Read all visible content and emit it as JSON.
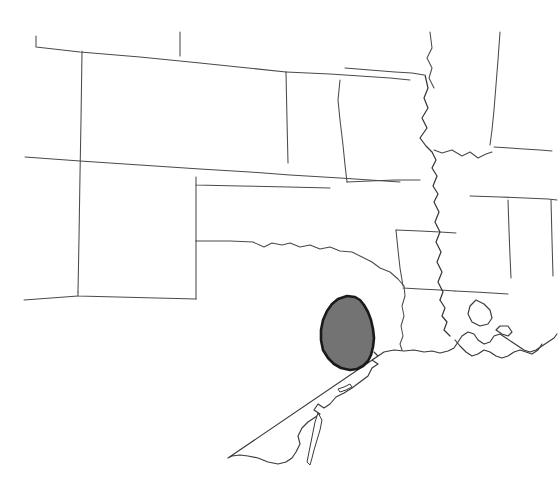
{
  "figure": {
    "kind": "distribution-range-map",
    "region_description": "South-central United States",
    "width": 558,
    "height": 485,
    "background_color": "#ffffff"
  },
  "style": {
    "state_border_color": "#4a4a4a",
    "coastline_color": "#3a3a3a",
    "river_color": "#333333",
    "range_fill_color": "#737373",
    "range_outline_color": "#1a1a1a",
    "range_fill_opacity": "1"
  },
  "range": {
    "label": "shaded-distribution-area",
    "location": "southeast Texas coastal plain",
    "fill_color": "#737373",
    "outline_color": "#1a1a1a",
    "bounds": {
      "x_min": 321,
      "y_min": 296,
      "x_max": 375,
      "y_max": 370
    },
    "path": "M 355 297 L 347 296 L 338 299 L 332 304 L 327 311 L 323 320 L 321 330 L 321 340 L 323 350 L 328 358 L 334 364 L 341 368 L 350 370 L 357 369 L 363 366 L 368 361 L 371 355 L 373 347 L 374 338 L 373 329 L 371 320 L 368 312 L 364 305 L 360 300 Z"
  },
  "geography": {
    "state_borders": [
      {
        "name": "colorado-wyoming-nebraska-north",
        "path": "M 36 36 L 36 47 L 80 52 L 140 57 L 200 63 L 248 68 L 286 72"
      },
      {
        "name": "wyoming-nebraska-vertical-tick",
        "path": "M 180 32 L 180 56"
      },
      {
        "name": "utah-colorado-west",
        "path": "M 82 51 L 81 120 L 80 175 L 79 238 L 78 292"
      },
      {
        "name": "colorado-south-kansas-south",
        "path": "M 25 157 L 80 161 L 140 165 L 200 169 L 250 172 L 290 175 L 340 178 L 400 182"
      },
      {
        "name": "colorado-east-kansas-west",
        "path": "M 286 72 L 287 120 L 288 163"
      },
      {
        "name": "kansas-oklahoma-panhandle-step",
        "path": "M 196 177 L 196 185 L 240 186 L 288 187 L 330 188"
      },
      {
        "name": "oklahoma-panhandle-west",
        "path": "M 196 185 L 196 241"
      },
      {
        "name": "texas-panhandle-north-west",
        "path": "M 78 292 L 78 296 L 196 299"
      },
      {
        "name": "new-mexico-texas-east",
        "path": "M 196 241 L 196 299"
      },
      {
        "name": "new-mexico-south-border",
        "path": "M 24 300 L 78 296"
      },
      {
        "name": "oklahoma-texas-red-river",
        "path": "M 196 241 L 230 241 L 253 242 L 264 247 L 272 243 L 282 245 L 290 243 L 300 247 L 310 245 L 320 249 L 330 247 L 340 251 L 352 252 L 362 257 L 372 262 L 380 268 L 390 272 L 398 279 L 404 286"
      },
      {
        "name": "arkansas-north-missouri-south",
        "path": "M 396 230 L 420 231 L 440 232 L 456 233"
      },
      {
        "name": "arkansas-west-oklahoma-east",
        "path": "M 396 230 L 398 250 L 400 268 L 403 286"
      },
      {
        "name": "arkansas-south-louisiana-north",
        "path": "M 403 288 L 420 289 L 440 290 L 455 291"
      },
      {
        "name": "texas-louisiana-east-sabine",
        "path": "M 404 286 L 405 296 L 402 306 L 404 316 L 401 326 L 403 336 L 400 344 L 402 350"
      },
      {
        "name": "kansas-nebraska-north-missouri",
        "path": "M 286 72 L 330 74 L 360 76 L 390 78 L 410 80"
      },
      {
        "name": "missouri-iowa-north",
        "path": "M 345 68 L 370 70 L 395 72 L 412 73 L 424 75"
      },
      {
        "name": "missouri-west-kansas-east",
        "path": "M 340 80 L 338 100 L 340 120 L 343 145 L 345 165 L 347 182"
      },
      {
        "name": "missouri-south-arkansas-north",
        "path": "M 347 182 L 370 181 L 395 180 L 420 180"
      },
      {
        "name": "illinois-iowa-north-tick",
        "path": "M 430 32 L 432 48 L 427 58 L 432 68 L 429 78 L 434 88"
      },
      {
        "name": "indiana-illinois-wabash",
        "path": "M 500 32 L 498 60 L 496 85 L 494 110 L 492 130 L 490 145"
      },
      {
        "name": "kentucky-tennessee-north",
        "path": "M 494 147 L 510 148 L 524 149 L 540 150 L 552 151"
      },
      {
        "name": "tennessee-mississippi-alabama-north",
        "path": "M 470 196 L 500 197 L 525 198 L 548 199 L 557 200"
      },
      {
        "name": "mississippi-alabama-vertical",
        "path": "M 508 200 L 509 230 L 510 256 L 511 278"
      },
      {
        "name": "alabama-georgia-vertical",
        "path": "M 551 200 L 552 240 L 553 276"
      },
      {
        "name": "mississippi-louisiana-north",
        "path": "M 455 291 L 475 292 L 492 293 L 508 294"
      },
      {
        "name": "kentucky-illinois-ohio-river",
        "path": "M 434 150 L 442 153 L 452 150 L 462 156 L 470 152 L 478 158 L 486 154 L 492 152"
      }
    ],
    "rivers": [
      {
        "name": "mississippi-river-missouri-illinois",
        "path": "M 425 75 L 428 88 L 424 98 L 428 108 L 422 118 L 427 128 L 420 138 L 426 146 L 432 152 L 436 160 L 432 168 L 437 176 L 433 186 L 438 194 L 434 202 L 439 212 L 435 222 L 440 232 L 436 242 L 441 252 L 437 262 L 442 272 L 438 282 L 443 292 L 440 300"
      },
      {
        "name": "mississippi-river-lower",
        "path": "M 440 300 L 445 308 L 442 316 L 447 322 L 444 330 L 450 336"
      }
    ],
    "coastline": {
      "name": "gulf-of-mexico-coastline",
      "path": "M 374 352 L 378 356 L 372 360 L 378 364 L 372 368 L 368 376 L 360 382 L 352 388 L 344 393 L 336 397 L 330 404 L 324 408 L 318 404 L 314 410 L 320 414 L 314 418 L 308 422 L 302 428 L 298 436 L 300 444 L 296 452 L 292 458 L 286 462 L 278 464 L 268 462 L 258 458 L 248 456 L 240 455 L 232 456 L 228 458 L 384 352 M 384 352 L 394 350 L 404 351 L 414 350 L 424 352 L 432 351 L 440 353 L 448 351 L 454 348 L 458 342 L 462 336 L 468 332 L 474 334 L 478 340 L 484 344 L 490 342 L 494 336 L 500 334 L 506 338 L 512 342 L 518 346 L 524 350 L 530 352 L 536 350 L 542 346 L 548 342 L 554 338 L 557 334"
    },
    "gulf_coast_detail": {
      "name": "louisiana-delta-and-bays",
      "path": "M 455 340 L 460 346 L 466 352 L 472 356 L 478 354 L 484 350 L 490 352 L 496 356 L 502 358 L 508 356 L 514 352 L 520 350 L 526 352 L 532 354 L 538 350 L 542 344 M 476 300 L 470 306 L 468 314 L 472 322 L 480 326 L 488 324 L 492 318 L 490 310 L 484 304 Z M 496 330 L 502 334 L 508 336 L 512 332 L 508 326 L 500 326 Z"
    },
    "barrier_islands": [
      {
        "name": "padre-island",
        "path": "M 318 413 L 322 420 L 320 430 L 317 440 L 314 450 L 312 458 L 310 465 L 307 462 L 309 452 L 311 442 L 313 432 L 315 422 Z"
      },
      {
        "name": "matagorda-island",
        "path": "M 340 392 L 346 390 L 352 387 L 350 384 L 344 387 L 338 389 Z"
      }
    ]
  }
}
